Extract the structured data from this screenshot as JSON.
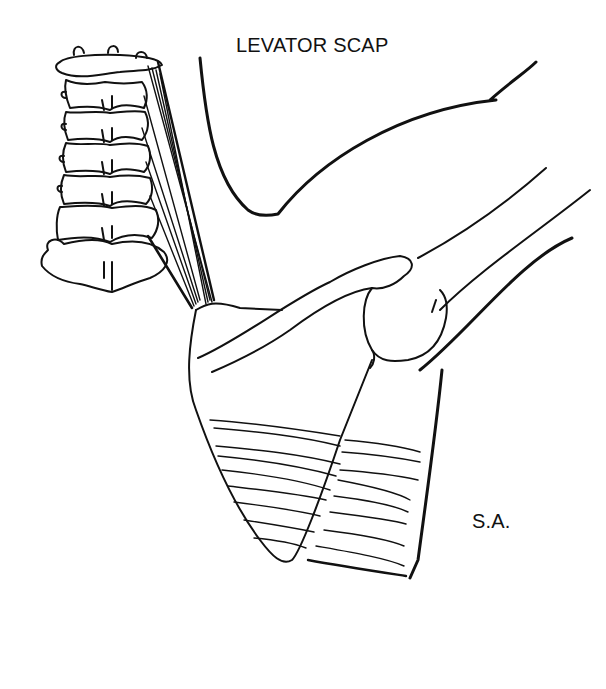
{
  "figure": {
    "type": "anatomical line drawing",
    "labels": {
      "levator": "LEVATOR SCAP",
      "serratus": "S.A."
    },
    "colors": {
      "background": "#ffffff",
      "ink": "#111111"
    }
  }
}
